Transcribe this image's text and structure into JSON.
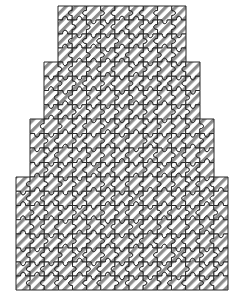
{
  "figure": {
    "title": "",
    "type": "jigsaw-ziggurat-diagram",
    "canvas": {
      "width": 245,
      "height": 304,
      "background": "#ffffff"
    },
    "style": {
      "cell_size": 14.2,
      "stroke_color": "#262626",
      "stroke_width": 1.0,
      "hatch_color": "#8c8c8c",
      "hatch_width": 3.2,
      "hatch_spacing": 7.1,
      "hatch_angle_deg": 45,
      "piece_fill": "#ffffff",
      "tab_radius": 2.6
    },
    "tiers": [
      {
        "name": "tier-1-top",
        "columns": 9,
        "rows": 4,
        "x": 58,
        "y": 6,
        "width": 128,
        "height": 56
      },
      {
        "name": "tier-2",
        "columns": 11,
        "rows": 4,
        "x": 44,
        "y": 62,
        "width": 156,
        "height": 57
      },
      {
        "name": "tier-3",
        "columns": 13,
        "rows": 4,
        "x": 30,
        "y": 119,
        "width": 184,
        "height": 58
      },
      {
        "name": "tier-4",
        "columns": 15,
        "rows": 4,
        "x": 16,
        "y": 177,
        "width": 212,
        "height": 57
      },
      {
        "name": "tier-5-bottom",
        "columns": 15,
        "rows": 4,
        "x": 16,
        "y": 234,
        "width": 212,
        "height": 56
      }
    ],
    "totals": {
      "tier_count": 5,
      "piece_count": 252,
      "widest_tier_columns": 15,
      "narrowest_tier_columns": 9
    }
  }
}
